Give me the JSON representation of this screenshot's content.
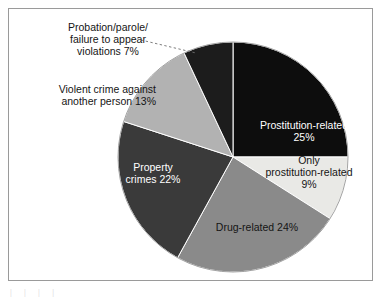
{
  "chart_data": {
    "type": "pie",
    "title": "",
    "subtitle": "",
    "xlabel": "",
    "ylabel": "",
    "legend_position": "none",
    "grid": false,
    "units": "percent",
    "start_angle_deg": 0,
    "direction": "clockwise",
    "categories": [
      "Prostitution-related",
      "Only prostitution-related",
      "Drug-related",
      "Property crimes",
      "Violent crime against another person",
      "Probation/parole/failure to appear violations"
    ],
    "values": [
      25,
      9,
      24,
      22,
      13,
      7
    ],
    "slices": [
      {
        "name": "Prostitution-related",
        "label_line1": "Prostitution-related",
        "label_line2": "25%",
        "value": 25,
        "value_text": "25%",
        "color": "#0d0d0d",
        "text_color": "#ffffff",
        "label_placement": "inside"
      },
      {
        "name": "Only prostitution-related",
        "label_line1": "Only",
        "label_line2": "prostitution-related",
        "label_line3": "9%",
        "value": 9,
        "value_text": "9%",
        "color": "#e9e9e6",
        "text_color": "#151515",
        "label_placement": "inside"
      },
      {
        "name": "Drug-related",
        "label_line1": "Drug-related 24%",
        "value": 24,
        "value_text": "24%",
        "color": "#8a8a8a",
        "text_color": "#151515",
        "label_placement": "inside"
      },
      {
        "name": "Property crimes",
        "label_line1": "Property",
        "label_line2": "crimes 22%",
        "value": 22,
        "value_text": "22%",
        "color": "#3a3a3a",
        "text_color": "#ffffff",
        "label_placement": "inside"
      },
      {
        "name": "Violent crime against another person",
        "label_line1": "Violent crime against",
        "label_line2": "another person 13%",
        "value": 13,
        "value_text": "13%",
        "color": "#b2b2b2",
        "text_color": "#151515",
        "label_placement": "outside-left"
      },
      {
        "name": "Probation/parole/failure to appear violations",
        "label_line1": "Probation/parole/",
        "label_line2": "failure to appear",
        "label_line3": "violations 7%",
        "value": 7,
        "value_text": "7%",
        "color": "#1c1c1c",
        "text_color": "#151515",
        "label_placement": "outside-top-left",
        "has_leader_line": true,
        "leader_line_style": "dashed"
      }
    ]
  },
  "labels": {
    "prostitution_related": "Prostitution-related\n25%",
    "only_prostitution_related": "Only\nprostitution-related\n9%",
    "drug_related": "Drug-related 24%",
    "property_crimes": "Property\ncrimes 22%",
    "violent_crime": "Violent crime against\nanother person 13%",
    "probation": "Probation/parole/\nfailure to appear\nviolations 7%"
  },
  "artifact": {
    "bottom_text": "|   |  | |"
  }
}
